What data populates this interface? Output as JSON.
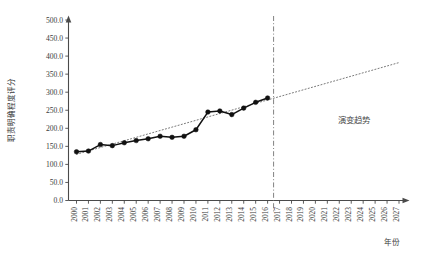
{
  "chart_data": {
    "type": "line",
    "title": "",
    "xlabel": "年份",
    "ylabel": "职责明确程度评分",
    "ylim": [
      0,
      500
    ],
    "ytick_values": [
      0,
      50,
      100,
      150,
      200,
      250,
      300,
      350,
      400,
      450,
      500
    ],
    "ytick_labels": [
      "0.0",
      "50.0",
      "100.0",
      "150.0",
      "200.0",
      "250.0",
      "300.0",
      "350.0",
      "400.0",
      "450.0",
      "500.0"
    ],
    "xlim": [
      2000,
      2027
    ],
    "categories": [
      "2000",
      "2001",
      "2002",
      "2003",
      "2004",
      "2005",
      "2006",
      "2007",
      "2008",
      "2009",
      "2010",
      "2011",
      "2012",
      "2013",
      "2014",
      "2015",
      "2016",
      "2017",
      "2018",
      "2019",
      "2020",
      "2021",
      "2022",
      "2023",
      "2024",
      "2025",
      "2026",
      "2027"
    ],
    "grid": false,
    "legend": "none",
    "series": [
      {
        "name": "职责明确程度评分",
        "style": "solid-with-markers",
        "marker": "filled-circle",
        "color": "#111111",
        "x": [
          2000,
          2001,
          2002,
          2003,
          2004,
          2005,
          2006,
          2007,
          2008,
          2009,
          2010,
          2011,
          2012,
          2013,
          2014,
          2015,
          2016
        ],
        "values": [
          135,
          137,
          155,
          152,
          160,
          166,
          171,
          178,
          175,
          178,
          196,
          245,
          248,
          238,
          256,
          272,
          284
        ]
      },
      {
        "name": "演变趋势",
        "style": "dotted-trend",
        "color": "#7a7a7a",
        "x": [
          2000,
          2027
        ],
        "values": [
          128,
          382
        ]
      }
    ],
    "annotations": [
      {
        "text": "演变趋势",
        "x": 2023.2,
        "y": 215
      }
    ],
    "reference_lines": [
      {
        "orientation": "vertical",
        "at": 2016.5,
        "style": "dash-dot",
        "color": "#6d6d6d"
      }
    ]
  },
  "axes": {
    "y_axis_title": "职责明确程度评分",
    "x_axis_title": "年份"
  }
}
